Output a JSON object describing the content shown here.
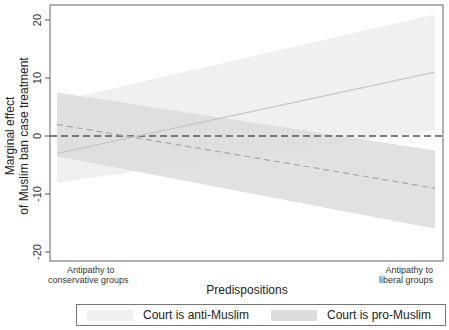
{
  "chart_data": {
    "type": "line",
    "title": "",
    "xlabel": "Predispositions",
    "ylabel": "Marginal effect\nof Muslim ban case treatment",
    "ylabel_lines": [
      "Marginal effect",
      "of Muslim ban case treatment"
    ],
    "ylim": [
      -22,
      22
    ],
    "yticks": [
      -20,
      -10,
      0,
      10,
      20
    ],
    "ytick_labels": [
      "-20",
      "-10",
      "0",
      "10",
      "20"
    ],
    "x_annotations": {
      "left": [
        "Antipathy to",
        "conservative groups"
      ],
      "right": [
        "Antipathy to",
        "liberal groups"
      ]
    },
    "x": [
      0,
      1
    ],
    "reference_line": {
      "y": 0,
      "style": "dashed",
      "color": "#555555"
    },
    "grid": false,
    "legend_position": "bottom",
    "series": [
      {
        "name": "Court is anti-Muslim",
        "values": [
          -3,
          11
        ],
        "ci_lower": [
          -8,
          1
        ],
        "ci_upper": [
          6,
          21
        ],
        "line_style": "solid",
        "line_color": "#c8c8c8",
        "fill_color": "#f0f0f0"
      },
      {
        "name": "Court is pro-Muslim",
        "values": [
          2,
          -9
        ],
        "ci_lower": [
          -3.5,
          -16
        ],
        "ci_upper": [
          7.5,
          -2.5
        ],
        "line_style": "dashed",
        "line_color": "#a8a8a8",
        "fill_color": "#dcdcdc"
      }
    ]
  },
  "legend": {
    "items": [
      {
        "label": "Court is anti-Muslim",
        "color": "#f0f0f0"
      },
      {
        "label": "Court is pro-Muslim",
        "color": "#dcdcdc"
      }
    ]
  }
}
